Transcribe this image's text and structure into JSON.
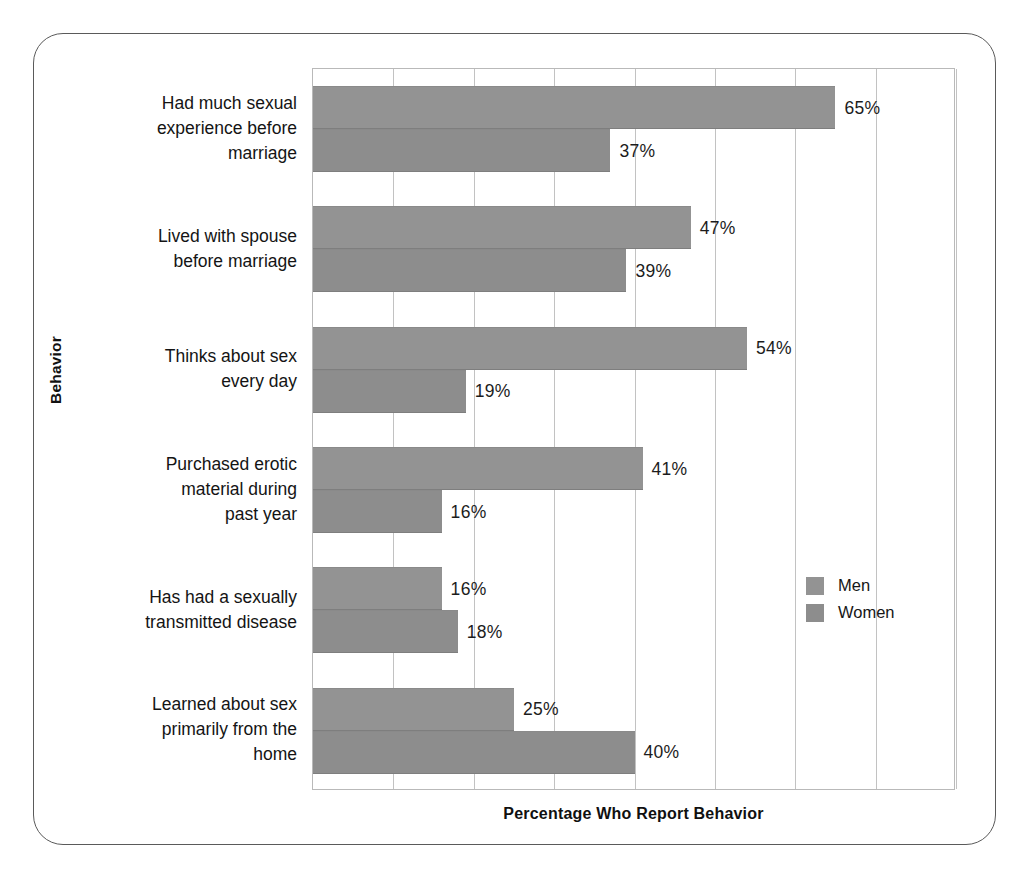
{
  "chart_data": {
    "type": "bar",
    "orientation": "horizontal",
    "title": "",
    "xlabel": "Percentage Who Report Behavior",
    "ylabel": "Behavior",
    "xlim": [
      0,
      80
    ],
    "xticks": [
      0,
      10,
      20,
      30,
      40,
      50,
      60,
      70,
      80
    ],
    "xtick_labels": [
      "",
      "",
      "",
      "",
      "",
      "",
      "",
      "",
      ""
    ],
    "grid": true,
    "legend_position": "inside-lower-right",
    "categories": [
      "Had much sexual experience before marriage",
      "Lived with spouse before marriage",
      "Thinks about sex every day",
      "Purchased erotic material during past year",
      "Has had a sexually transmitted disease",
      "Learned about sex primarily from the home"
    ],
    "category_label_lines": [
      [
        "Had much sexual",
        "experience before",
        "marriage"
      ],
      [
        "Lived with spouse",
        "before marriage"
      ],
      [
        "Thinks about sex",
        "every day"
      ],
      [
        "Purchased erotic",
        "material during",
        "past year"
      ],
      [
        "Has had a sexually",
        "transmitted disease"
      ],
      [
        "Learned about sex",
        "primarily from the",
        "home"
      ]
    ],
    "series": [
      {
        "name": "Men",
        "color": "#939393",
        "values": [
          65,
          47,
          54,
          41,
          16,
          25
        ],
        "value_labels": [
          "65%",
          "47%",
          "54%",
          "41%",
          "16%",
          "25%"
        ]
      },
      {
        "name": "Women",
        "color": "#8d8d8d",
        "values": [
          37,
          39,
          19,
          16,
          18,
          40
        ],
        "value_labels": [
          "37%",
          "39%",
          "19%",
          "16%",
          "18%",
          "40%"
        ]
      }
    ]
  },
  "axes": {
    "y_title": "Behavior",
    "x_title": "Percentage Who Report Behavior"
  },
  "legend": {
    "entries": [
      {
        "label": "Men",
        "color": "#939393"
      },
      {
        "label": "Women",
        "color": "#8d8d8d"
      }
    ]
  },
  "colors": {
    "bar_fill": "#939393",
    "gridline": "#c2c2c2",
    "plot_border": "#b9b9b9",
    "frame_border": "#5a5a5a",
    "text": "#141414",
    "background": "#ffffff"
  }
}
